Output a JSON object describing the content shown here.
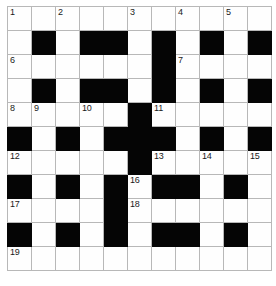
{
  "puzzle": {
    "kind": "crossword-grid",
    "rows": 11,
    "columns": 11,
    "colors": {
      "block": "#050505",
      "cell": "#fefefe",
      "grid_line": "#b8b8b8",
      "outer_border": "#8a8a8a",
      "number_text": "#1a1a1a"
    },
    "cells": [
      [
        {
          "block": false,
          "number": "1"
        },
        {
          "block": false,
          "number": ""
        },
        {
          "block": false,
          "number": "2"
        },
        {
          "block": false,
          "number": ""
        },
        {
          "block": false,
          "number": ""
        },
        {
          "block": false,
          "number": "3"
        },
        {
          "block": false,
          "number": ""
        },
        {
          "block": false,
          "number": "4"
        },
        {
          "block": false,
          "number": ""
        },
        {
          "block": false,
          "number": "5"
        },
        {
          "block": false,
          "number": ""
        }
      ],
      [
        {
          "block": false,
          "number": ""
        },
        {
          "block": true,
          "number": ""
        },
        {
          "block": false,
          "number": ""
        },
        {
          "block": true,
          "number": ""
        },
        {
          "block": true,
          "number": ""
        },
        {
          "block": false,
          "number": ""
        },
        {
          "block": true,
          "number": ""
        },
        {
          "block": false,
          "number": ""
        },
        {
          "block": true,
          "number": ""
        },
        {
          "block": false,
          "number": ""
        },
        {
          "block": true,
          "number": ""
        }
      ],
      [
        {
          "block": false,
          "number": "6"
        },
        {
          "block": false,
          "number": ""
        },
        {
          "block": false,
          "number": ""
        },
        {
          "block": false,
          "number": ""
        },
        {
          "block": false,
          "number": ""
        },
        {
          "block": false,
          "number": ""
        },
        {
          "block": true,
          "number": ""
        },
        {
          "block": false,
          "number": "7"
        },
        {
          "block": false,
          "number": ""
        },
        {
          "block": false,
          "number": ""
        },
        {
          "block": false,
          "number": ""
        }
      ],
      [
        {
          "block": false,
          "number": ""
        },
        {
          "block": true,
          "number": ""
        },
        {
          "block": false,
          "number": ""
        },
        {
          "block": true,
          "number": ""
        },
        {
          "block": true,
          "number": ""
        },
        {
          "block": false,
          "number": ""
        },
        {
          "block": true,
          "number": ""
        },
        {
          "block": false,
          "number": ""
        },
        {
          "block": true,
          "number": ""
        },
        {
          "block": false,
          "number": ""
        },
        {
          "block": true,
          "number": ""
        }
      ],
      [
        {
          "block": false,
          "number": "8"
        },
        {
          "block": false,
          "number": "9"
        },
        {
          "block": false,
          "number": ""
        },
        {
          "block": false,
          "number": "10"
        },
        {
          "block": false,
          "number": ""
        },
        {
          "block": true,
          "number": ""
        },
        {
          "block": false,
          "number": "11"
        },
        {
          "block": false,
          "number": ""
        },
        {
          "block": false,
          "number": ""
        },
        {
          "block": false,
          "number": ""
        },
        {
          "block": false,
          "number": ""
        }
      ],
      [
        {
          "block": true,
          "number": ""
        },
        {
          "block": false,
          "number": ""
        },
        {
          "block": true,
          "number": ""
        },
        {
          "block": false,
          "number": ""
        },
        {
          "block": true,
          "number": ""
        },
        {
          "block": true,
          "number": ""
        },
        {
          "block": true,
          "number": ""
        },
        {
          "block": false,
          "number": ""
        },
        {
          "block": true,
          "number": ""
        },
        {
          "block": false,
          "number": ""
        },
        {
          "block": true,
          "number": ""
        }
      ],
      [
        {
          "block": false,
          "number": "12"
        },
        {
          "block": false,
          "number": ""
        },
        {
          "block": false,
          "number": ""
        },
        {
          "block": false,
          "number": ""
        },
        {
          "block": false,
          "number": ""
        },
        {
          "block": true,
          "number": ""
        },
        {
          "block": false,
          "number": "13"
        },
        {
          "block": false,
          "number": ""
        },
        {
          "block": false,
          "number": "14"
        },
        {
          "block": false,
          "number": ""
        },
        {
          "block": false,
          "number": "15"
        }
      ],
      [
        {
          "block": true,
          "number": ""
        },
        {
          "block": false,
          "number": ""
        },
        {
          "block": true,
          "number": ""
        },
        {
          "block": false,
          "number": ""
        },
        {
          "block": true,
          "number": ""
        },
        {
          "block": false,
          "number": "16"
        },
        {
          "block": true,
          "number": ""
        },
        {
          "block": true,
          "number": ""
        },
        {
          "block": false,
          "number": ""
        },
        {
          "block": true,
          "number": ""
        },
        {
          "block": false,
          "number": ""
        }
      ],
      [
        {
          "block": false,
          "number": "17"
        },
        {
          "block": false,
          "number": ""
        },
        {
          "block": false,
          "number": ""
        },
        {
          "block": false,
          "number": ""
        },
        {
          "block": true,
          "number": ""
        },
        {
          "block": false,
          "number": "18"
        },
        {
          "block": false,
          "number": ""
        },
        {
          "block": false,
          "number": ""
        },
        {
          "block": false,
          "number": ""
        },
        {
          "block": false,
          "number": ""
        },
        {
          "block": false,
          "number": ""
        }
      ],
      [
        {
          "block": true,
          "number": ""
        },
        {
          "block": false,
          "number": ""
        },
        {
          "block": true,
          "number": ""
        },
        {
          "block": false,
          "number": ""
        },
        {
          "block": true,
          "number": ""
        },
        {
          "block": false,
          "number": ""
        },
        {
          "block": true,
          "number": ""
        },
        {
          "block": true,
          "number": ""
        },
        {
          "block": false,
          "number": ""
        },
        {
          "block": true,
          "number": ""
        },
        {
          "block": false,
          "number": ""
        }
      ],
      [
        {
          "block": false,
          "number": "19"
        },
        {
          "block": false,
          "number": ""
        },
        {
          "block": false,
          "number": ""
        },
        {
          "block": false,
          "number": ""
        },
        {
          "block": false,
          "number": ""
        },
        {
          "block": false,
          "number": ""
        },
        {
          "block": false,
          "number": ""
        },
        {
          "block": false,
          "number": ""
        },
        {
          "block": false,
          "number": ""
        },
        {
          "block": false,
          "number": ""
        },
        {
          "block": false,
          "number": ""
        }
      ]
    ]
  }
}
